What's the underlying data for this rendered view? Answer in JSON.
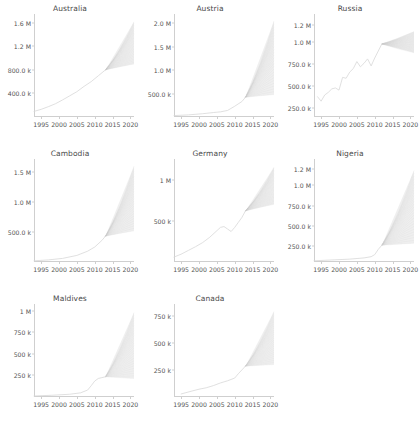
{
  "figure": {
    "layout": "3x3 grid, 8 panels, bottom-right empty",
    "background": "#ffffff",
    "line_color": "#d8d8d8",
    "cone_color": "#c9c9c9"
  },
  "chart_data": [
    {
      "type": "line",
      "title": "Australia",
      "xlabel": "",
      "ylabel": "",
      "grid": false,
      "legend": null,
      "xlim": [
        1993,
        2021
      ],
      "ylim": [
        0,
        1750000
      ],
      "xticks": [
        1995,
        2000,
        2005,
        2010,
        2015,
        2020
      ],
      "xticklabels": [
        "1995",
        "2000",
        "2005",
        "2010",
        "2015",
        "2020"
      ],
      "yticks": [
        400000,
        800000,
        1200000,
        1600000
      ],
      "yticklabels": [
        "400.0 k",
        "800.0 k",
        "1.2 M",
        "1.6 M"
      ],
      "x": [
        1993,
        1995,
        1997,
        1999,
        2001,
        2003,
        2005,
        2007,
        2009,
        2011,
        2013
      ],
      "y": [
        95000,
        130000,
        175000,
        225000,
        290000,
        360000,
        430000,
        520000,
        600000,
        700000,
        800000
      ],
      "forecast": {
        "start_x": 2013,
        "start_y": 800000,
        "end_x": 2021,
        "end_low": 900000,
        "end_high": 1620000
      }
    },
    {
      "type": "line",
      "title": "Austria",
      "xlabel": "",
      "ylabel": "",
      "grid": false,
      "legend": null,
      "xlim": [
        1993,
        2021
      ],
      "ylim": [
        0,
        2200000
      ],
      "xticks": [
        1995,
        2000,
        2005,
        2010,
        2015,
        2020
      ],
      "xticklabels": [
        "1995",
        "2000",
        "2005",
        "2010",
        "2015",
        "2020"
      ],
      "yticks": [
        500000,
        1000000,
        1500000,
        2000000
      ],
      "yticklabels": [
        "500.0 k",
        "1.0 M",
        "1.5 M",
        "2.0 M"
      ],
      "x": [
        1993,
        1997,
        2001,
        2004,
        2006,
        2008,
        2010,
        2012,
        2013
      ],
      "y": [
        30000,
        45000,
        70000,
        95000,
        110000,
        140000,
        230000,
        330000,
        420000
      ],
      "forecast": {
        "start_x": 2013,
        "start_y": 420000,
        "end_x": 2021,
        "end_low": 480000,
        "end_high": 2050000
      }
    },
    {
      "type": "line",
      "title": "Russia",
      "xlabel": "",
      "ylabel": "",
      "grid": false,
      "legend": null,
      "xlim": [
        1993,
        2021
      ],
      "ylim": [
        150000,
        1320000
      ],
      "xticks": [
        1995,
        2000,
        2005,
        2010,
        2015,
        2020
      ],
      "xticklabels": [
        "1995",
        "2000",
        "2005",
        "2010",
        "2015",
        "2020"
      ],
      "yticks": [
        250000,
        500000,
        750000,
        1000000,
        1200000
      ],
      "yticklabels": [
        "250.0 k",
        "500.0 k",
        "750.0 k",
        "1.0 M",
        "1.2 M"
      ],
      "x": [
        1994,
        1995,
        1996,
        1997,
        1998,
        1999,
        2000,
        2001,
        2002,
        2003,
        2004,
        2005,
        2006,
        2007,
        2008,
        2009,
        2010,
        2011,
        2012
      ],
      "y": [
        380000,
        330000,
        400000,
        430000,
        470000,
        480000,
        455000,
        600000,
        590000,
        660000,
        700000,
        780000,
        720000,
        760000,
        810000,
        730000,
        820000,
        900000,
        980000
      ],
      "forecast": {
        "start_x": 2012,
        "start_y": 980000,
        "end_x": 2021,
        "end_low": 880000,
        "end_high": 1120000
      }
    },
    {
      "type": "line",
      "title": "Cambodia",
      "xlabel": "",
      "ylabel": "",
      "grid": false,
      "legend": null,
      "xlim": [
        1993,
        2021
      ],
      "ylim": [
        0,
        1720000
      ],
      "xticks": [
        1995,
        2000,
        2005,
        2010,
        2015,
        2020
      ],
      "xticklabels": [
        "1995",
        "2000",
        "2005",
        "2010",
        "2015",
        "2020"
      ],
      "yticks": [
        500000,
        1000000,
        1500000
      ],
      "yticklabels": [
        "500.0 k",
        "1.0 M",
        "1.5 M"
      ],
      "x": [
        1993,
        1997,
        2001,
        2005,
        2008,
        2010,
        2012,
        2013
      ],
      "y": [
        20000,
        35000,
        60000,
        110000,
        180000,
        250000,
        360000,
        430000
      ],
      "forecast": {
        "start_x": 2013,
        "start_y": 430000,
        "end_x": 2021,
        "end_low": 520000,
        "end_high": 1600000
      }
    },
    {
      "type": "line",
      "title": "Germany",
      "xlabel": "",
      "ylabel": "",
      "grid": false,
      "legend": null,
      "xlim": [
        1993,
        2021
      ],
      "ylim": [
        0,
        1250000
      ],
      "xticks": [
        1995,
        2000,
        2005,
        2010,
        2015,
        2020
      ],
      "xticklabels": [
        "1995",
        "2000",
        "2005",
        "2010",
        "2015",
        "2020"
      ],
      "yticks": [
        500000,
        1000000
      ],
      "yticklabels": [
        "500 k",
        "1 M"
      ],
      "x": [
        1993,
        1995,
        1997,
        1999,
        2001,
        2003,
        2005,
        2006,
        2007,
        2008,
        2009,
        2010,
        2011,
        2012,
        2013
      ],
      "y": [
        60000,
        95000,
        140000,
        185000,
        235000,
        300000,
        380000,
        420000,
        430000,
        400000,
        370000,
        420000,
        480000,
        540000,
        620000
      ],
      "forecast": {
        "start_x": 2013,
        "start_y": 620000,
        "end_x": 2021,
        "end_low": 700000,
        "end_high": 1150000
      }
    },
    {
      "type": "line",
      "title": "Nigeria",
      "xlabel": "",
      "ylabel": "",
      "grid": false,
      "legend": null,
      "xlim": [
        1993,
        2021
      ],
      "ylim": [
        60000,
        1320000
      ],
      "xticks": [
        1995,
        2000,
        2005,
        2010,
        2015,
        2020
      ],
      "xticklabels": [
        "1995",
        "2000",
        "2005",
        "2010",
        "2015",
        "2020"
      ],
      "yticks": [
        250000,
        500000,
        750000,
        1000000,
        1200000
      ],
      "yticklabels": [
        "250.0 k",
        "500.0 k",
        "750.0 k",
        "1.0 M",
        "1.2 M"
      ],
      "x": [
        1993,
        1998,
        2003,
        2007,
        2009,
        2010,
        2011,
        2012
      ],
      "y": [
        75000,
        85000,
        95000,
        110000,
        125000,
        150000,
        215000,
        265000
      ],
      "forecast": {
        "start_x": 2012,
        "start_y": 265000,
        "end_x": 2021,
        "end_low": 290000,
        "end_high": 1180000
      }
    },
    {
      "type": "line",
      "title": "Maldives",
      "xlabel": "",
      "ylabel": "",
      "grid": false,
      "legend": null,
      "xlim": [
        1993,
        2021
      ],
      "ylim": [
        0,
        1080000
      ],
      "xticks": [
        1995,
        2000,
        2005,
        2010,
        2015,
        2020
      ],
      "xticklabels": [
        "1995",
        "2000",
        "2005",
        "2010",
        "2015",
        "2020"
      ],
      "yticks": [
        250000,
        500000,
        750000,
        1000000
      ],
      "yticklabels": [
        "250 k",
        "500 k",
        "750 k",
        "1 M"
      ],
      "x": [
        1993,
        1998,
        2003,
        2006,
        2008,
        2009,
        2010,
        2011,
        2012,
        2013
      ],
      "y": [
        12000,
        20000,
        32000,
        48000,
        80000,
        130000,
        185000,
        215000,
        225000,
        235000
      ],
      "forecast": {
        "start_x": 2013,
        "start_y": 235000,
        "end_x": 2021,
        "end_low": 215000,
        "end_high": 980000
      }
    },
    {
      "type": "line",
      "title": "Canada",
      "xlabel": "",
      "ylabel": "",
      "grid": false,
      "legend": null,
      "xlim": [
        1993,
        2021
      ],
      "ylim": [
        0,
        860000
      ],
      "xticks": [
        1995,
        2000,
        2005,
        2010,
        2015,
        2020
      ],
      "xticklabels": [
        "1995",
        "2000",
        "2005",
        "2010",
        "2015",
        "2020"
      ],
      "yticks": [
        250000,
        500000,
        750000
      ],
      "yticklabels": [
        "250 k",
        "500 k",
        "750 k"
      ],
      "x": [
        1995,
        1998,
        2000,
        2002,
        2004,
        2006,
        2008,
        2010,
        2011,
        2012,
        2013
      ],
      "y": [
        28000,
        55000,
        72000,
        85000,
        105000,
        130000,
        150000,
        175000,
        215000,
        250000,
        285000
      ],
      "forecast": {
        "start_x": 2013,
        "start_y": 285000,
        "end_x": 2021,
        "end_low": 300000,
        "end_high": 790000
      }
    }
  ]
}
